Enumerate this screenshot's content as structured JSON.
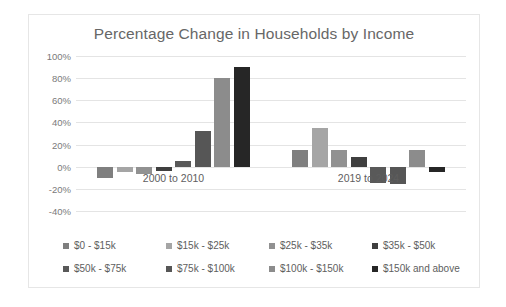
{
  "chart_data": {
    "type": "bar",
    "title": "Percentage Change in Households by Income",
    "xlabel": "",
    "ylabel": "",
    "categories": [
      "2000 to 2010",
      "2019 to 2024"
    ],
    "ylim": [
      -40,
      100
    ],
    "ytick_labels": [
      "100%",
      "80%",
      "60%",
      "40%",
      "20%",
      "0%",
      "-20%",
      "-40%"
    ],
    "ytick_values": [
      100,
      80,
      60,
      40,
      20,
      0,
      -20,
      -40
    ],
    "grid": true,
    "legend_position": "bottom",
    "value_format": "percent",
    "series": [
      {
        "name": "$0 - $15k",
        "color": "#7f7f7f",
        "values": [
          -10,
          15
        ]
      },
      {
        "name": "$15k - $25k",
        "color": "#a5a5a5",
        "values": [
          -5,
          35
        ]
      },
      {
        "name": "$25k - $35k",
        "color": "#919191",
        "values": [
          -7,
          15
        ]
      },
      {
        "name": "$35k - $50k",
        "color": "#3f3f3f",
        "values": [
          -4,
          9
        ]
      },
      {
        "name": "$50k - $75k",
        "color": "#595959",
        "values": [
          5,
          -15
        ]
      },
      {
        "name": "$75k - $100k",
        "color": "#565656",
        "values": [
          32,
          -16
        ]
      },
      {
        "name": "$100k - $150k",
        "color": "#8c8c8c",
        "values": [
          80,
          15
        ]
      },
      {
        "name": "$150k and above",
        "color": "#262626",
        "values": [
          90,
          -5
        ]
      }
    ]
  },
  "colors": {
    "title_text": "#676767",
    "axis_text": "#7a7a7a",
    "gridline": "#e4e4e4",
    "frame_border": "#e6e6e6",
    "background": "#ffffff"
  }
}
